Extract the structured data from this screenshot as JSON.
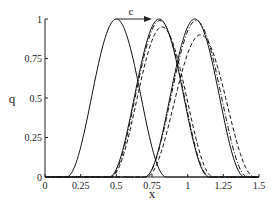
{
  "chart_data": {
    "type": "line",
    "title": "",
    "xlabel": "x",
    "ylabel": "q",
    "xlim": [
      0,
      1.5
    ],
    "ylim": [
      0,
      1
    ],
    "grid": false,
    "legend": null,
    "xticks": [
      "0",
      "0.25",
      "0.5",
      "0.75",
      "1",
      "1.25",
      "1.5"
    ],
    "yticks": [
      "0",
      "0.25",
      "0.5",
      "0.75",
      "1"
    ],
    "annotations": [
      {
        "text": "c",
        "type": "arrow",
        "from": [
          0.5,
          1.0
        ],
        "to": [
          0.73,
          1.0
        ]
      }
    ],
    "series": [
      {
        "name": "initial pulse",
        "style": "solid",
        "center": 0.5,
        "halfwidth": 0.35,
        "amplitude": 1.0
      },
      {
        "name": "pulse t1 exact",
        "style": "solid",
        "center": 0.8,
        "halfwidth": 0.35,
        "amplitude": 1.0
      },
      {
        "name": "pulse t1 scheme A",
        "style": "dashdot",
        "center": 0.805,
        "halfwidth": 0.35,
        "amplitude": 0.99
      },
      {
        "name": "pulse t1 scheme B",
        "style": "dashed",
        "center": 0.82,
        "halfwidth": 0.36,
        "amplitude": 0.95
      },
      {
        "name": "pulse t2 exact",
        "style": "solid",
        "center": 1.05,
        "halfwidth": 0.35,
        "amplitude": 1.0
      },
      {
        "name": "pulse t2 scheme A",
        "style": "dashdot",
        "center": 1.06,
        "halfwidth": 0.36,
        "amplitude": 0.99
      },
      {
        "name": "pulse t2 scheme B",
        "style": "dashed",
        "center": 1.09,
        "halfwidth": 0.38,
        "amplitude": 0.9
      }
    ]
  },
  "axes": {
    "xlabel": "x",
    "ylabel": "q",
    "arrow_label": "c"
  }
}
